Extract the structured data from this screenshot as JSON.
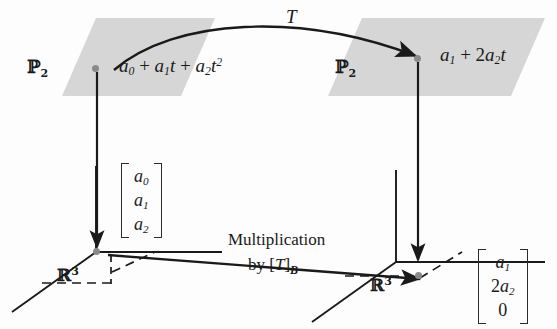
{
  "figure": {
    "colors": {
      "plane_fill": "#d6d6d6",
      "stroke": "#1a1a1a",
      "dot": "#8a8a8a",
      "background": "#ffffff"
    }
  },
  "planes": [
    {
      "name": "left-plane",
      "label": "P",
      "label_sub": "2"
    },
    {
      "name": "right-plane",
      "label": "P",
      "label_sub": "2"
    }
  ],
  "top_arrow": {
    "label": "T"
  },
  "domain_element": {
    "a0": "a",
    "a0_sub": "0",
    "plus1": " + ",
    "a1": "a",
    "a1_sub": "1",
    "t1": "t",
    "plus2": " + ",
    "a2": "a",
    "a2_sub": "2",
    "t2": "t",
    "t2_sup": "2"
  },
  "codomain_element": {
    "a1": "a",
    "a1_sub": "1",
    "plus": " + ",
    "coef": "2",
    "a2": "a",
    "a2_sub": "2",
    "t": "t"
  },
  "spaces": [
    {
      "name": "left-r3",
      "symbol": "R",
      "exponent": "3"
    },
    {
      "name": "right-r3",
      "symbol": "R",
      "exponent": "3"
    }
  ],
  "coordinate_vectors": {
    "left": {
      "rows": [
        "a0",
        "a1",
        "a2"
      ],
      "display": [
        "a₀",
        "a₁",
        "a₂"
      ]
    },
    "right": {
      "rows": [
        "a1",
        "2a2",
        "0"
      ],
      "display": [
        "a₁",
        "2a₂",
        "0"
      ]
    }
  },
  "bottom_arrow": {
    "line1": "Multiplication",
    "line2_prefix": "by [",
    "line2_operator": "T",
    "line2_suffix": "]",
    "line2_basis": "B"
  },
  "vertical_arrows": [
    {
      "name": "left-coordinate-map",
      "direction": "down"
    },
    {
      "name": "right-coordinate-map",
      "direction": "down"
    }
  ]
}
